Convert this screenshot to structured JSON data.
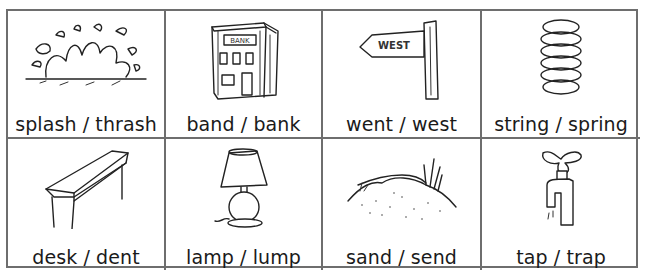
{
  "worksheet": {
    "cards": [
      {
        "label": "splash / thrash",
        "icon": "splash-icon"
      },
      {
        "label": "band / bank",
        "icon": "bank-building-icon",
        "sign_text": "BANK"
      },
      {
        "label": "went / west",
        "icon": "signpost-icon",
        "sign_text": "WEST"
      },
      {
        "label": "string / spring",
        "icon": "spring-coil-icon"
      },
      {
        "label": "desk / dent",
        "icon": "desk-icon"
      },
      {
        "label": "lamp / lump",
        "icon": "table-lamp-icon"
      },
      {
        "label": "sand / send",
        "icon": "sand-dune-icon"
      },
      {
        "label": "tap / trap",
        "icon": "water-tap-icon"
      }
    ]
  }
}
